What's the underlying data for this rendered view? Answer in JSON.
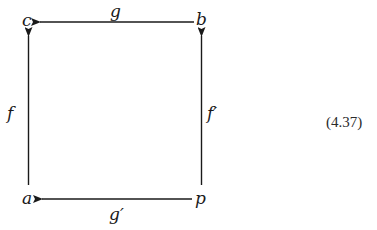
{
  "diagram": {
    "type": "commutative-square",
    "nodes": {
      "top_left": "c",
      "top_right": "b",
      "bottom_left": "a",
      "bottom_right": "p"
    },
    "arrows": {
      "top": {
        "label": "g",
        "from": "b",
        "to": "c"
      },
      "bottom": {
        "label": "g′",
        "from": "p",
        "to": "a"
      },
      "left": {
        "label": "f",
        "from": "a",
        "to": "c"
      },
      "right": {
        "label": "f′",
        "from": "p",
        "to": "b"
      }
    },
    "equation_number": "(4.37)",
    "colors": {
      "ink": "#1a1a1a",
      "background": "#ffffff"
    }
  }
}
